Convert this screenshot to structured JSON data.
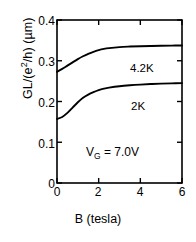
{
  "chart_data": {
    "type": "line",
    "title": "",
    "xlabel": "B (tesla)",
    "ylabel": "GL/(e2/h) (µm)",
    "ylabel_parts": {
      "pre": "GL/(e",
      "sup": "2",
      "post": "/h) (µm)"
    },
    "xlim": [
      0,
      6
    ],
    "ylim": [
      0,
      0.4
    ],
    "xticks": [
      "0",
      "2",
      "4",
      "6"
    ],
    "xtick_values": [
      0,
      2,
      4,
      6
    ],
    "yticks": [
      "0",
      "0.1",
      "0.2",
      "0.3",
      "0.4"
    ],
    "ytick_values": [
      0,
      0.1,
      0.2,
      0.3,
      0.4
    ],
    "grid": false,
    "legend_position": "inline-right",
    "line_color": "#000000",
    "axis_color": "#000000",
    "background": "#ffffff",
    "series": [
      {
        "name": "4.2K",
        "label": "4.2K",
        "x": [
          0,
          0.25,
          0.5,
          0.75,
          1.0,
          1.25,
          1.5,
          1.75,
          2.0,
          2.25,
          2.5,
          3.0,
          3.5,
          4.0,
          4.5,
          5.0,
          5.5,
          6.0
        ],
        "values": [
          0.273,
          0.28,
          0.288,
          0.296,
          0.304,
          0.311,
          0.317,
          0.322,
          0.326,
          0.329,
          0.331,
          0.3335,
          0.3348,
          0.3357,
          0.3363,
          0.3368,
          0.3372,
          0.3375
        ]
      },
      {
        "name": "2K",
        "label": "2K",
        "x": [
          0,
          0.25,
          0.5,
          0.75,
          1.0,
          1.25,
          1.5,
          1.75,
          2.0,
          2.25,
          2.5,
          3.0,
          3.5,
          4.0,
          4.5,
          5.0,
          5.5,
          6.0
        ],
        "values": [
          0.157,
          0.162,
          0.172,
          0.185,
          0.198,
          0.209,
          0.217,
          0.223,
          0.228,
          0.2315,
          0.234,
          0.2375,
          0.2398,
          0.2415,
          0.2428,
          0.2438,
          0.2446,
          0.2452
        ]
      }
    ],
    "annotations": [
      {
        "id": "series-label-4p2k",
        "text": "4.2K",
        "x": 3.55,
        "y": 0.305
      },
      {
        "id": "series-label-2k",
        "text": "2K",
        "x": 3.6,
        "y": 0.213
      },
      {
        "id": "gate-voltage",
        "text": "VG = 7.0V",
        "pre": "V",
        "sub": "G",
        "post": " =  7.0V",
        "x": 2.05,
        "y": 0.085
      }
    ]
  }
}
